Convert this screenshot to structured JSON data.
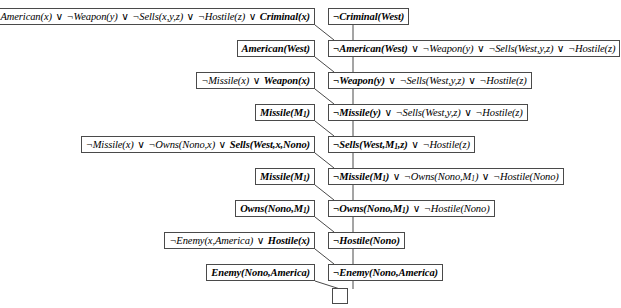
{
  "figure": {
    "name": "resolution-proof-tree",
    "symbols": {
      "negation": "¬",
      "disjunction": "∨",
      "empty_clause": "□"
    },
    "left_column": [
      {
        "id": "kb-colonel-west-rule",
        "html": "¬American(x) <span class=\"op\">∨</span> ¬Weapon(y) <span class=\"op\">∨</span> ¬Sells(x,y,z) <span class=\"op\">∨</span> ¬Hostile(z) <span class=\"op\">∨</span> <b>Criminal(x)</b>",
        "text": "¬American(x) ∨ ¬Weapon(y) ∨ ¬Sells(x,y,z) ∨ ¬Hostile(z) ∨ Criminal(x)",
        "top": 8,
        "right": 315
      },
      {
        "id": "kb-american-west",
        "html": "<b>American(West)</b>",
        "text": "American(West)",
        "top": 40,
        "right": 315
      },
      {
        "id": "kb-missile-implies-weapon",
        "html": "¬Missile(x) <span class=\"op\">∨</span> <b>Weapon(x)</b>",
        "text": "¬Missile(x) ∨ Weapon(x)",
        "top": 72,
        "right": 315
      },
      {
        "id": "kb-missile-m1-a",
        "html": "<b>Missile(M<sub>1</sub>)</b>",
        "text": "Missile(M1)",
        "top": 104,
        "right": 315
      },
      {
        "id": "kb-nono-sells-rule",
        "html": "¬Missile(x) <span class=\"op\">∨</span> ¬Owns(Nono,x) <span class=\"op\">∨</span> <b>Sells(West,x,Nono)</b>",
        "text": "¬Missile(x) ∨ ¬Owns(Nono,x) ∨ Sells(West,x,Nono)",
        "top": 136,
        "right": 315
      },
      {
        "id": "kb-missile-m1-b",
        "html": "<b>Missile(M<sub>1</sub>)</b>",
        "text": "Missile(M1)",
        "top": 168,
        "right": 315
      },
      {
        "id": "kb-owns-nono-m1",
        "html": "<b>Owns(Nono,M<sub>1</sub>)</b>",
        "text": "Owns(Nono,M1)",
        "top": 200,
        "right": 315
      },
      {
        "id": "kb-enemy-implies-hostile",
        "html": "¬Enemy(x,America) <span class=\"op\">∨</span> <b>Hostile(x)</b>",
        "text": "¬Enemy(x,America) ∨ Hostile(x)",
        "top": 232,
        "right": 315
      },
      {
        "id": "kb-enemy-nono-america",
        "html": "<b>Enemy(Nono,America)</b>",
        "text": "Enemy(Nono,America)",
        "top": 264,
        "right": 315
      }
    ],
    "right_column": [
      {
        "id": "goal-not-criminal-west",
        "html": "<b>¬Criminal(West)</b>",
        "text": "¬Criminal(West)",
        "top": 8,
        "left": 328
      },
      {
        "id": "res-not-american-west",
        "html": "<b>¬American(West)</b> <span class=\"op\">∨</span> ¬Weapon(y) <span class=\"op\">∨</span> ¬Sells(West,y,z) <span class=\"op\">∨</span> ¬Hostile(z)",
        "text": "¬American(West) ∨ ¬Weapon(y) ∨ ¬Sells(West,y,z) ∨ ¬Hostile(z)",
        "top": 40,
        "left": 328
      },
      {
        "id": "res-not-weapon-y",
        "html": "<b>¬Weapon(y)</b> <span class=\"op\">∨</span> ¬Sells(West,y,z) <span class=\"op\">∨</span> ¬Hostile(z)",
        "text": "¬Weapon(y) ∨ ¬Sells(West,y,z) ∨ ¬Hostile(z)",
        "top": 72,
        "left": 328
      },
      {
        "id": "res-not-missile-y",
        "html": "<b>¬Missile(y)</b> <span class=\"op\">∨</span> ¬Sells(West,y,z) <span class=\"op\">∨</span> ¬Hostile(z)",
        "text": "¬Missile(y) ∨ ¬Sells(West,y,z) ∨ ¬Hostile(z)",
        "top": 104,
        "left": 328
      },
      {
        "id": "res-not-sells-west-m1-z",
        "html": "<b>¬Sells(West,M<sub>1</sub>,z)</b> <span class=\"op\">∨</span> ¬Hostile(z)",
        "text": "¬Sells(West,M1,z) ∨ ¬Hostile(z)",
        "top": 136,
        "left": 328
      },
      {
        "id": "res-not-missile-m1",
        "html": "<b>¬Missile(M<sub>1</sub>)</b> <span class=\"op\">∨</span> ¬Owns(Nono,M<sub>1</sub>) <span class=\"op\">∨</span> ¬Hostile(Nono)",
        "text": "¬Missile(M1) ∨ ¬Owns(Nono,M1) ∨ ¬Hostile(Nono)",
        "top": 168,
        "left": 328
      },
      {
        "id": "res-not-owns-nono-m1",
        "html": "<b>¬Owns(Nono,M<sub>1</sub>)</b> <span class=\"op\">∨</span> ¬Hostile(Nono)",
        "text": "¬Owns(Nono,M1) ∨ ¬Hostile(Nono)",
        "top": 200,
        "left": 328
      },
      {
        "id": "res-not-hostile-nono",
        "html": "<b>¬Hostile(Nono)</b>",
        "text": "¬Hostile(Nono)",
        "top": 232,
        "left": 328
      },
      {
        "id": "res-not-enemy-nono-america",
        "html": "<b>¬Enemy(Nono,America)</b>",
        "text": "¬Enemy(Nono,America)",
        "top": 264,
        "left": 328
      }
    ],
    "empty_clause": {
      "id": "empty-clause-box",
      "top": 288,
      "left": 332,
      "text": ""
    },
    "edges": {
      "diagonals": [
        {
          "x1": 315,
          "y1": 25,
          "x2": 334,
          "y2": 40
        },
        {
          "x1": 315,
          "y1": 57,
          "x2": 334,
          "y2": 72
        },
        {
          "x1": 315,
          "y1": 89,
          "x2": 334,
          "y2": 104
        },
        {
          "x1": 315,
          "y1": 121,
          "x2": 334,
          "y2": 136
        },
        {
          "x1": 315,
          "y1": 153,
          "x2": 334,
          "y2": 168
        },
        {
          "x1": 315,
          "y1": 185,
          "x2": 334,
          "y2": 200
        },
        {
          "x1": 315,
          "y1": 217,
          "x2": 334,
          "y2": 232
        },
        {
          "x1": 315,
          "y1": 249,
          "x2": 334,
          "y2": 264
        },
        {
          "x1": 315,
          "y1": 281,
          "x2": 340,
          "y2": 289
        }
      ],
      "verticals": [
        {
          "x": 353,
          "y1": 25,
          "y2": 40
        },
        {
          "x": 353,
          "y1": 57,
          "y2": 72
        },
        {
          "x": 353,
          "y1": 89,
          "y2": 104
        },
        {
          "x": 353,
          "y1": 121,
          "y2": 136
        },
        {
          "x": 353,
          "y1": 153,
          "y2": 168
        },
        {
          "x": 353,
          "y1": 185,
          "y2": 200
        },
        {
          "x": 353,
          "y1": 217,
          "y2": 232
        },
        {
          "x": 353,
          "y1": 249,
          "y2": 264
        },
        {
          "x": 353,
          "y1": 281,
          "y2": 289
        }
      ]
    },
    "stroke_color": "#4a4a4a"
  }
}
